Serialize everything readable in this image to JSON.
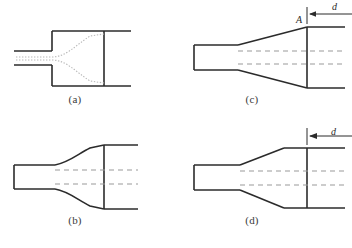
{
  "figure": {
    "background_color": "#ffffff",
    "line_color": "#2b2b2b",
    "dashed_color": "#9a9a9a",
    "dotted_color": "#b0b0b0",
    "width": 352,
    "height": 248
  },
  "panels": [
    {
      "id": "a",
      "caption": "(a)",
      "description": "sudden expansion with dotted jet streamlines",
      "has_centerlines": false,
      "has_dotted_streamlines": true,
      "has_dimension": false
    },
    {
      "id": "b",
      "caption": "(b)",
      "description": "gradual conical diffuser with dashed centerlines",
      "has_centerlines": true,
      "has_dotted_streamlines": false,
      "has_dimension": false
    },
    {
      "id": "c",
      "caption": "(c)",
      "description": "conical diffuser with exit point A and long dimension d",
      "has_centerlines": true,
      "has_dotted_streamlines": false,
      "has_dimension": true,
      "point_label": "A",
      "dimension_label": "d",
      "dimension_length": "long"
    },
    {
      "id": "d",
      "caption": "(d)",
      "description": "conical diffuser with short dimension d",
      "has_centerlines": true,
      "has_dotted_streamlines": false,
      "has_dimension": true,
      "dimension_label": "d",
      "dimension_length": "short"
    }
  ],
  "annotations": {
    "point_A": "A",
    "dimension_d_c": "d",
    "dimension_d_d": "d"
  }
}
